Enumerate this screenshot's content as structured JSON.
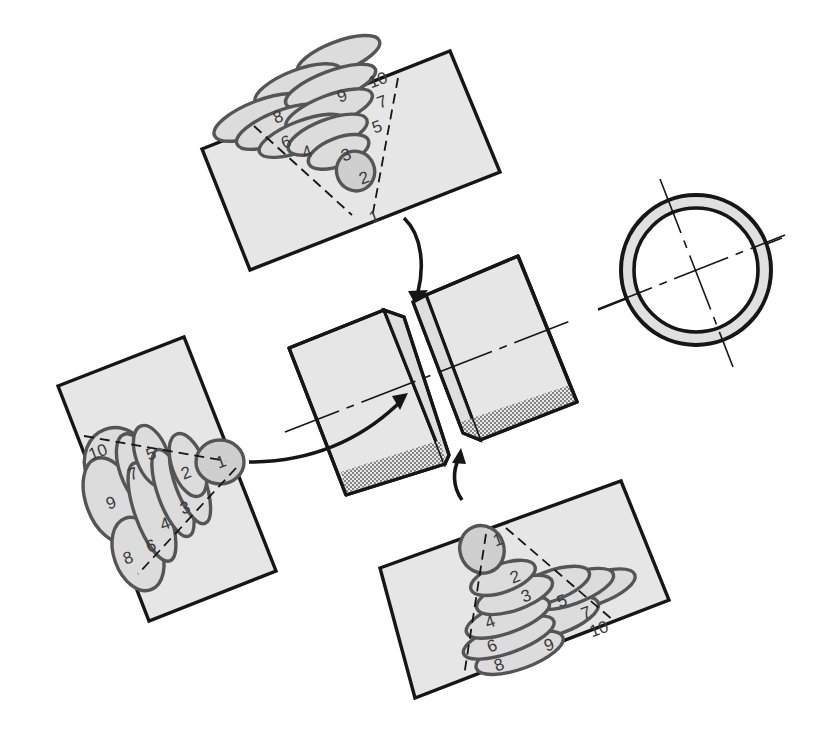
{
  "diagram": {
    "colors": {
      "plate_fill": "#e6e6e6",
      "bead_fill": "#dcdcdc",
      "bead_outline": "#555555",
      "line": "#161616",
      "background": "#ffffff"
    },
    "views": {
      "top": {
        "label": "top-view-weld-sequence",
        "bead_numbers": [
          "1",
          "2",
          "3",
          "4",
          "5",
          "6",
          "7",
          "8",
          "9",
          "10"
        ]
      },
      "left": {
        "label": "side-view-weld-sequence",
        "bead_numbers": [
          "1",
          "2",
          "3",
          "4",
          "5",
          "6",
          "7",
          "8",
          "9",
          "10"
        ]
      },
      "bottom": {
        "label": "bottom-view-weld-sequence",
        "bead_numbers": [
          "1",
          "2",
          "3",
          "4",
          "5",
          "6",
          "7",
          "8",
          "9",
          "10"
        ]
      },
      "center": {
        "label": "pipe-joint-with-v-groove"
      },
      "right": {
        "label": "pipe-cross-section-ring"
      }
    }
  }
}
